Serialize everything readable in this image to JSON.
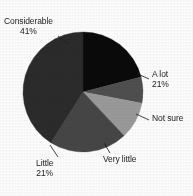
{
  "chart_data": {
    "type": "pie",
    "title": "",
    "subtitle": "",
    "xlabel": "",
    "ylabel": "",
    "grid": false,
    "legend_position": "none",
    "label_style": "outside-with-leader-lines",
    "center": {
      "x": 83,
      "y": 92,
      "radius": 60
    },
    "start_angle_deg": 0,
    "direction": "clockwise",
    "categories": [
      "A lot",
      "Not sure",
      "Very little",
      "Little",
      "Considerable"
    ],
    "values": [
      21,
      7,
      10,
      21,
      41
    ],
    "slices": [
      {
        "label": "A lot",
        "value": 21,
        "value_text": "21%",
        "show_value": true,
        "color": "#0a0a0a",
        "start_deg": 0,
        "end_deg": 75.6,
        "leader": {
          "x1": 149,
          "y1": 79,
          "x2": 138,
          "y2": 74
        }
      },
      {
        "label": "Not sure",
        "value": 7,
        "value_text": "",
        "show_value": false,
        "color": "#4f4f4f",
        "start_deg": 75.6,
        "end_deg": 100.8,
        "leader": {
          "x1": 149,
          "y1": 120,
          "x2": 136,
          "y2": 114
        }
      },
      {
        "label": "Very little",
        "value": 10,
        "value_text": "",
        "show_value": false,
        "color": "#9a9a9a",
        "start_deg": 100.8,
        "end_deg": 136.8,
        "leader": {
          "x1": 110,
          "y1": 153,
          "x2": 104,
          "y2": 143
        }
      },
      {
        "label": "Little",
        "value": 21,
        "value_text": "21%",
        "show_value": true,
        "color": "#464646",
        "start_deg": 136.8,
        "end_deg": 212.4,
        "leader": {
          "x1": 58,
          "y1": 157,
          "x2": 50,
          "y2": 145
        }
      },
      {
        "label": "Considerable",
        "value": 41,
        "value_text": "41%",
        "show_value": true,
        "color": "#2b2b2b",
        "start_deg": 212.4,
        "end_deg": 360,
        "leader": {
          "x1": 58,
          "y1": 36,
          "x2": 68,
          "y2": 44
        }
      }
    ]
  },
  "labels": {
    "considerable": {
      "name": "Considerable",
      "pct": "41%"
    },
    "alot": {
      "name": "A lot",
      "pct": "21%"
    },
    "notsure": {
      "name": "Not sure",
      "pct": ""
    },
    "verylittle": {
      "name": "Very little",
      "pct": ""
    },
    "little": {
      "name": "Little",
      "pct": "21%"
    }
  }
}
